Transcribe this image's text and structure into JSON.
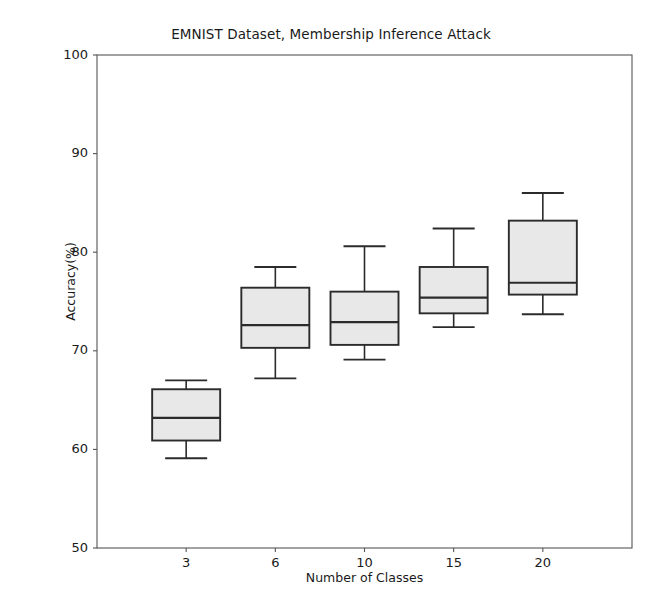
{
  "chart_data": {
    "type": "box",
    "title": "EMNIST Dataset, Membership Inference Attack",
    "xlabel": "Number of Classes",
    "ylabel": "Accuracy(%)",
    "categories": [
      "3",
      "6",
      "10",
      "15",
      "20"
    ],
    "ylim": [
      50,
      100
    ],
    "yticks": [
      50,
      60,
      70,
      80,
      90,
      100
    ],
    "ytick_labels": [
      "50",
      "60",
      "70",
      "80",
      "90",
      "100"
    ],
    "grid": false,
    "legend": null,
    "box_fill_color": "#e8e8e8",
    "box_edge_color": "#2b2b2b",
    "boxes": [
      {
        "category": "3",
        "whisker_low": 59.1,
        "q1": 60.9,
        "median": 63.2,
        "q3": 66.1,
        "whisker_high": 67.0
      },
      {
        "category": "6",
        "whisker_low": 67.2,
        "q1": 70.3,
        "median": 72.6,
        "q3": 76.4,
        "whisker_high": 78.5
      },
      {
        "category": "10",
        "whisker_low": 69.1,
        "q1": 70.6,
        "median": 72.9,
        "q3": 76.0,
        "whisker_high": 80.6
      },
      {
        "category": "15",
        "whisker_low": 72.4,
        "q1": 73.8,
        "median": 75.4,
        "q3": 78.5,
        "whisker_high": 82.4
      },
      {
        "category": "20",
        "whisker_low": 73.7,
        "q1": 75.7,
        "median": 76.9,
        "q3": 83.2,
        "whisker_high": 86.0
      }
    ]
  }
}
